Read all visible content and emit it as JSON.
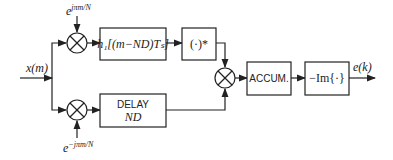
{
  "diagram": {
    "input_label": "x(m)",
    "output_label": "e(k)",
    "top_mixer_label": {
      "base": "e",
      "exp": "jπm/N"
    },
    "bottom_mixer_label": {
      "base": "e",
      "exp": "−jπm/N"
    },
    "blocks": {
      "filter": "h₁[(m−ND)Tₛ]",
      "conjugate": "(·)*",
      "delay_line1": "DELAY",
      "delay_line2": "ND",
      "accumulator": "ACCUM.",
      "imag": "−Im{·}"
    }
  }
}
